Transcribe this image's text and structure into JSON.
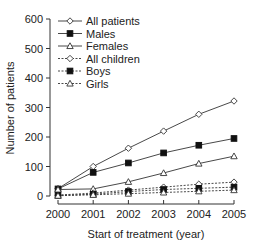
{
  "chart_data": {
    "type": "line",
    "title": "",
    "xlabel": "Start of treatment (year)",
    "ylabel": "Number of patients",
    "x": [
      2000,
      2001,
      2002,
      2003,
      2004,
      2005
    ],
    "xticks": [
      "2000",
      "2001",
      "2002",
      "2003",
      "2004",
      "2005"
    ],
    "yticks": [
      "0",
      "100",
      "200",
      "300",
      "400",
      "500",
      "600"
    ],
    "ylim": [
      0,
      600
    ],
    "grid": false,
    "legend_position": "upper-left",
    "series": [
      {
        "name": "All patients",
        "marker": "open-diamond",
        "line": "solid",
        "values": [
          25,
          100,
          162,
          220,
          277,
          322
        ]
      },
      {
        "name": "Males",
        "marker": "filled-square",
        "line": "solid",
        "values": [
          24,
          80,
          112,
          146,
          172,
          195
        ]
      },
      {
        "name": "Females",
        "marker": "open-triangle",
        "line": "solid",
        "values": [
          22,
          24,
          48,
          78,
          110,
          135
        ]
      },
      {
        "name": "All children",
        "marker": "open-diamond",
        "line": "dashed",
        "values": [
          3,
          10,
          20,
          30,
          40,
          47
        ]
      },
      {
        "name": "Boys",
        "marker": "filled-square",
        "line": "dashed",
        "values": [
          2,
          6,
          15,
          22,
          26,
          30
        ]
      },
      {
        "name": "Girls",
        "marker": "open-triangle",
        "line": "dashed",
        "values": [
          1,
          4,
          8,
          12,
          16,
          20
        ]
      }
    ]
  },
  "colors": {
    "line": "#333333",
    "text": "#222222",
    "background": "#ffffff"
  }
}
